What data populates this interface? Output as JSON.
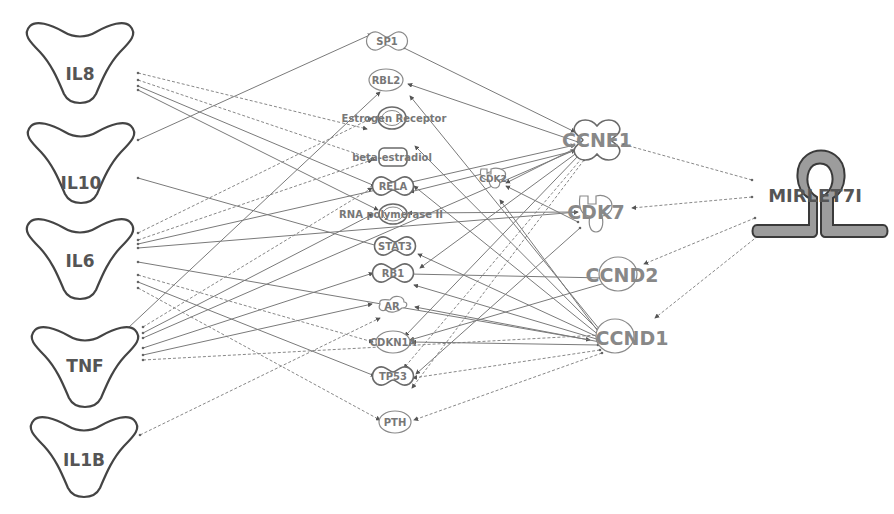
{
  "diagram": {
    "title": "",
    "colors": {
      "node_stroke": "#6a6a6a",
      "label": "#777777",
      "mirna_fill": "#9c9c9c",
      "edge": "#7a7a7a",
      "background": "#ffffff"
    },
    "nodes": {
      "IL8": {
        "label": "IL8",
        "type": "cytokine",
        "x": 75,
        "y": 62
      },
      "IL10": {
        "label": "IL10",
        "type": "cytokine",
        "x": 80,
        "y": 163
      },
      "IL6": {
        "label": "IL6",
        "type": "cytokine",
        "x": 80,
        "y": 260
      },
      "TNF": {
        "label": "TNF",
        "type": "cytokine",
        "x": 85,
        "y": 367
      },
      "IL1B": {
        "label": "IL1B",
        "type": "cytokine",
        "x": 85,
        "y": 457
      },
      "SP1": {
        "label": "SP1",
        "type": "transcription-regulator",
        "x": 387,
        "y": 41
      },
      "RBL2": {
        "label": "RBL2",
        "type": "other",
        "x": 387,
        "y": 80
      },
      "ESR": {
        "label": "Estrogen Receptor",
        "type": "complex",
        "x": 393,
        "y": 118
      },
      "BETA": {
        "label": "beta-estradiol",
        "type": "chemical",
        "x": 390,
        "y": 158
      },
      "RELA": {
        "label": "RELA",
        "type": "transcription-regulator",
        "x": 393,
        "y": 186
      },
      "RNAP": {
        "label": "RNA polymerase II",
        "type": "complex",
        "x": 393,
        "y": 213
      },
      "STAT3": {
        "label": "STAT3",
        "type": "transcription-regulator",
        "x": 395,
        "y": 246
      },
      "RB1": {
        "label": "RB1",
        "type": "transcription-regulator",
        "x": 393,
        "y": 273
      },
      "AR": {
        "label": "AR",
        "type": "ligand-receptor",
        "x": 392,
        "y": 306
      },
      "CDKN1A": {
        "label": "CDKN1A",
        "type": "other",
        "x": 393,
        "y": 342
      },
      "TP53": {
        "label": "TP53",
        "type": "transcription-regulator",
        "x": 393,
        "y": 376
      },
      "PTH": {
        "label": "PTH",
        "type": "other",
        "x": 395,
        "y": 422
      },
      "CDK2": {
        "label": "CDK2",
        "type": "kinase",
        "x": 493,
        "y": 178
      },
      "CCNE1": {
        "label": "CCNE1",
        "type": "transcription-regulator",
        "x": 595,
        "y": 140
      },
      "CDK7": {
        "label": "CDK7",
        "type": "kinase",
        "x": 596,
        "y": 212
      },
      "CCND2": {
        "label": "CCND2",
        "type": "other",
        "x": 623,
        "y": 275
      },
      "CCND1": {
        "label": "CCND1",
        "type": "other",
        "x": 616,
        "y": 338
      },
      "MIRLET7I": {
        "label": "MIRLET7I",
        "type": "microrna",
        "x": 815,
        "y": 195
      }
    },
    "node_order": [
      "IL8",
      "IL10",
      "IL6",
      "TNF",
      "IL1B",
      "SP1",
      "RBL2",
      "ESR",
      "BETA",
      "RELA",
      "RNAP",
      "STAT3",
      "RB1",
      "AR",
      "CDKN1A",
      "TP53",
      "PTH",
      "CDK2",
      "CCNE1",
      "CDK7",
      "CCND2",
      "CCND1",
      "MIRLET7I"
    ],
    "edges": [
      {
        "from": [
          138,
          73
        ],
        "to": [
          367,
          129
        ],
        "style": "dashed"
      },
      {
        "from": [
          138,
          80
        ],
        "to": [
          375,
          160
        ],
        "style": "dashed"
      },
      {
        "from": [
          138,
          86
        ],
        "to": [
          375,
          186
        ],
        "style": "solid"
      },
      {
        "from": [
          138,
          90
        ],
        "to": [
          378,
          210
        ],
        "style": "solid"
      },
      {
        "from": [
          138,
          140
        ],
        "to": [
          372,
          34
        ],
        "style": "solid"
      },
      {
        "from": [
          138,
          178
        ],
        "to": [
          378,
          246
        ],
        "style": "solid"
      },
      {
        "from": [
          138,
          233
        ],
        "to": [
          372,
          118
        ],
        "style": "dashed"
      },
      {
        "from": [
          138,
          240
        ],
        "to": [
          372,
          160
        ],
        "style": "dashed"
      },
      {
        "from": [
          138,
          244
        ],
        "to": [
          575,
          145
        ],
        "style": "solid"
      },
      {
        "from": [
          138,
          248
        ],
        "to": [
          578,
          212
        ],
        "style": "solid"
      },
      {
        "from": [
          138,
          262
        ],
        "to": [
          590,
          340
        ],
        "style": "solid"
      },
      {
        "from": [
          138,
          275
        ],
        "to": [
          373,
          342
        ],
        "style": "dashed"
      },
      {
        "from": [
          138,
          282
        ],
        "to": [
          375,
          376
        ],
        "style": "solid"
      },
      {
        "from": [
          138,
          288
        ],
        "to": [
          380,
          420
        ],
        "style": "dashed"
      },
      {
        "from": [
          128,
          328
        ],
        "to": [
          380,
          92
        ],
        "style": "solid"
      },
      {
        "from": [
          143,
          327
        ],
        "to": [
          372,
          188
        ],
        "style": "dashed"
      },
      {
        "from": [
          143,
          333
        ],
        "to": [
          373,
          214
        ],
        "style": "solid"
      },
      {
        "from": [
          143,
          338
        ],
        "to": [
          575,
          150
        ],
        "style": "solid"
      },
      {
        "from": [
          143,
          348
        ],
        "to": [
          373,
          273
        ],
        "style": "solid"
      },
      {
        "from": [
          143,
          355
        ],
        "to": [
          372,
          304
        ],
        "style": "solid"
      },
      {
        "from": [
          143,
          360
        ],
        "to": [
          600,
          335
        ],
        "style": "dashed"
      },
      {
        "from": [
          140,
          435
        ],
        "to": [
          380,
          318
        ],
        "style": "dashed"
      },
      {
        "from": [
          404,
          48
        ],
        "to": [
          575,
          132
        ],
        "style": "solid"
      },
      {
        "from": [
          578,
          142
        ],
        "to": [
          408,
          84
        ],
        "style": "solid"
      },
      {
        "from": [
          578,
          147
        ],
        "to": [
          506,
          183
        ],
        "style": "solid"
      },
      {
        "from": [
          578,
          150
        ],
        "to": [
          410,
          192
        ],
        "style": "solid"
      },
      {
        "from": [
          578,
          152
        ],
        "to": [
          420,
          268
        ],
        "style": "solid"
      },
      {
        "from": [
          580,
          154
        ],
        "to": [
          405,
          336
        ],
        "style": "solid"
      },
      {
        "from": [
          582,
          158
        ],
        "to": [
          404,
          368
        ],
        "style": "dashed"
      },
      {
        "from": [
          584,
          160
        ],
        "to": [
          412,
          388
        ],
        "style": "dashed"
      },
      {
        "from": [
          578,
          222
        ],
        "to": [
          506,
          186
        ],
        "style": "solid"
      },
      {
        "from": [
          575,
          212
        ],
        "to": [
          408,
          213
        ],
        "style": "solid"
      },
      {
        "from": [
          580,
          228
        ],
        "to": [
          416,
          374
        ],
        "style": "solid"
      },
      {
        "from": [
          605,
          278
        ],
        "to": [
          409,
          274
        ],
        "style": "solid"
      },
      {
        "from": [
          605,
          283
        ],
        "to": [
          410,
          340
        ],
        "style": "solid"
      },
      {
        "from": [
          600,
          330
        ],
        "to": [
          410,
          96
        ],
        "style": "solid"
      },
      {
        "from": [
          600,
          332
        ],
        "to": [
          415,
          146
        ],
        "style": "solid"
      },
      {
        "from": [
          600,
          334
        ],
        "to": [
          500,
          200
        ],
        "style": "solid"
      },
      {
        "from": [
          600,
          336
        ],
        "to": [
          414,
          186
        ],
        "style": "solid"
      },
      {
        "from": [
          600,
          338
        ],
        "to": [
          418,
          254
        ],
        "style": "solid"
      },
      {
        "from": [
          600,
          340
        ],
        "to": [
          414,
          285
        ],
        "style": "solid"
      },
      {
        "from": [
          600,
          342
        ],
        "to": [
          415,
          307
        ],
        "style": "solid"
      },
      {
        "from": [
          598,
          345
        ],
        "to": [
          412,
          342
        ],
        "style": "solid"
      },
      {
        "from": [
          600,
          350
        ],
        "to": [
          413,
          378
        ],
        "style": "dashed"
      },
      {
        "from": [
          602,
          353
        ],
        "to": [
          414,
          420
        ],
        "style": "dashed"
      },
      {
        "from": [
          752,
          180
        ],
        "to": [
          622,
          144
        ],
        "style": "dashed"
      },
      {
        "from": [
          752,
          197
        ],
        "to": [
          632,
          208
        ],
        "style": "dashed"
      },
      {
        "from": [
          755,
          218
        ],
        "to": [
          644,
          264
        ],
        "style": "dashed"
      },
      {
        "from": [
          758,
          236
        ],
        "to": [
          655,
          318
        ],
        "style": "dashed"
      }
    ]
  }
}
